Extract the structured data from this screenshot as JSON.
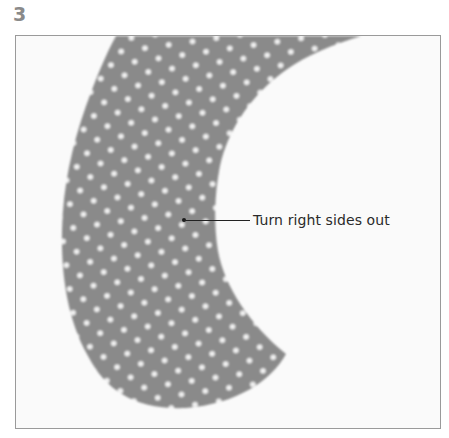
{
  "step": {
    "number": "3"
  },
  "figure": {
    "fabric_color": "#8a8a8a",
    "dot_color": "#f2f2f2",
    "background_color": "#fafafa",
    "frame_color": "#9a9a9a"
  },
  "callout": {
    "label": "Turn right sides out"
  }
}
